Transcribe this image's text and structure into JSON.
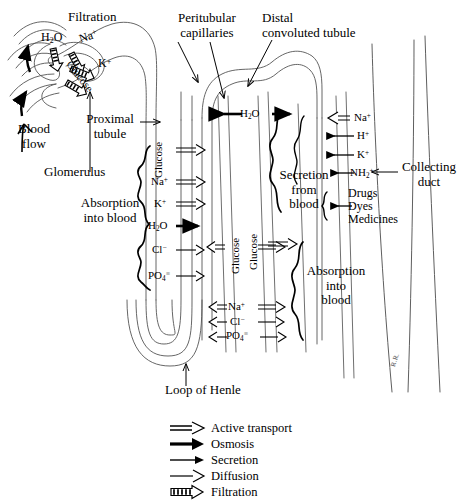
{
  "labels": {
    "filtration": "Filtration",
    "peritubular_capillaries": "Peritubular\ncapillaries",
    "peritubular_line1": "Peritubular",
    "peritubular_line2": "capillaries",
    "distal_line1": "Distal",
    "distal_line2": "convoluted tubule",
    "blood_line1": "Blood",
    "blood_line2": "flow",
    "glomerulus": "Glomerulus",
    "proximal_line1": "Proximal",
    "proximal_line2": "tubule",
    "absorption_line1": "Absorption",
    "absorption_line2": "into blood",
    "absorption2_line1": "Absorption",
    "absorption2_line2": "into",
    "absorption2_line3": "blood",
    "secretion_line1": "Secretion",
    "secretion_line2": "from",
    "secretion_line3": "blood",
    "collecting_line1": "Collecting",
    "collecting_line2": "duct",
    "loop_of_henle": "Loop of Henle",
    "signature": "R.R."
  },
  "glomerulus_solutes": [
    {
      "name": "H2O",
      "html": "H<sub>2</sub>O",
      "mode": "filtration"
    },
    {
      "name": "Na+",
      "html": "Na<sup>+</sup>",
      "mode": "filtration"
    },
    {
      "name": "K+",
      "html": "K<sup>+</sup>",
      "mode": "filtration"
    },
    {
      "name": "Glucose",
      "html": "Glucose",
      "mode": "filtration"
    }
  ],
  "proximal_transport": [
    {
      "name": "Glucose",
      "html": "Glucose",
      "mode": "active transport",
      "direction": "right",
      "orientation": "vertical"
    },
    {
      "name": "Na+",
      "html": "Na<sup>+</sup>",
      "mode": "active transport",
      "direction": "right",
      "orientation": "horizontal"
    },
    {
      "name": "K+",
      "html": "K<sup>+</sup>",
      "mode": "active transport",
      "direction": "right",
      "orientation": "horizontal"
    },
    {
      "name": "H2O",
      "html": "H<sub>2</sub>O",
      "mode": "osmosis",
      "direction": "right",
      "orientation": "horizontal"
    },
    {
      "name": "Cl-",
      "html": "Cl<sup>&minus;</sup>",
      "mode": "diffusion",
      "direction": "right",
      "orientation": "horizontal"
    },
    {
      "name": "PO4",
      "html": "PO<sub>4</sub><sup>&equiv;</sup>",
      "mode": "diffusion",
      "direction": "right",
      "orientation": "horizontal"
    }
  ],
  "loop_transport": [
    {
      "name": "Glucose",
      "html": "Glucose",
      "mode": "active transport",
      "direction": "both",
      "orientation": "vertical"
    },
    {
      "name": "Na+",
      "html": "Na<sup>+</sup>",
      "mode": "active transport",
      "direction": "both",
      "orientation": "horizontal"
    },
    {
      "name": "Cl-",
      "html": "Cl<sup>&minus;</sup>",
      "mode": "diffusion",
      "direction": "both",
      "orientation": "horizontal"
    },
    {
      "name": "PO4",
      "html": "PO<sub>4</sub><sup>&equiv;</sup>",
      "mode": "diffusion",
      "direction": "both",
      "orientation": "horizontal"
    }
  ],
  "distal_water": {
    "name": "H2O",
    "html": "H<sub>2</sub>O",
    "mode": "osmosis",
    "direction": "both"
  },
  "secretion_items": [
    {
      "name": "Na+",
      "html": "Na<sup>+</sup>",
      "mode": "active transport",
      "direction": "left"
    },
    {
      "name": "H+",
      "html": "H<sup>+</sup>",
      "mode": "secretion",
      "direction": "left"
    },
    {
      "name": "K+",
      "html": "K<sup>+</sup>",
      "mode": "secretion",
      "direction": "left"
    },
    {
      "name": "NH2+",
      "html": "NH<sub>2</sub><sup>+</sup>",
      "mode": "secretion",
      "direction": "left"
    }
  ],
  "secreted_substances": [
    "Drugs",
    "Dyes",
    "Medicines"
  ],
  "legend": [
    {
      "key": "active-transport",
      "label": "Active transport"
    },
    {
      "key": "osmosis",
      "label": "Osmosis"
    },
    {
      "key": "secretion",
      "label": "Secretion"
    },
    {
      "key": "diffusion",
      "label": "Diffusion"
    },
    {
      "key": "filtration",
      "label": "Filtration"
    }
  ],
  "colors": {
    "ink": "#000000",
    "line": "#555555",
    "bg": "#ffffff"
  }
}
